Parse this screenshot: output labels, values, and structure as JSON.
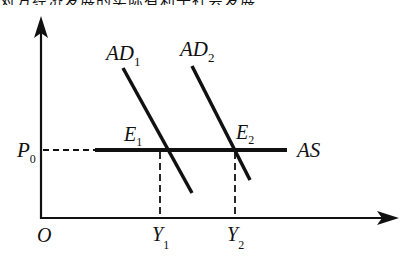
{
  "header": {
    "cropped_text": "对方经济发展的实际有利于社会发展"
  },
  "diagram": {
    "type": "AD-AS model",
    "axes": {
      "origin_label": "O",
      "y_axis": {
        "label": "",
        "arrow": true
      },
      "x_axis": {
        "label": "",
        "arrow": true
      }
    },
    "curves": [
      {
        "id": "AD1",
        "label": "AD",
        "subscript": "1",
        "kind": "downward-sloping"
      },
      {
        "id": "AD2",
        "label": "AD",
        "subscript": "2",
        "kind": "downward-sloping"
      },
      {
        "id": "AS",
        "label": "AS",
        "subscript": "",
        "kind": "horizontal"
      }
    ],
    "points": [
      {
        "id": "E1",
        "label": "E",
        "subscript": "1"
      },
      {
        "id": "E2",
        "label": "E",
        "subscript": "2"
      }
    ],
    "price_level": {
      "label": "P",
      "subscript": "0"
    },
    "output_levels": [
      {
        "label": "Y",
        "subscript": "1"
      },
      {
        "label": "Y",
        "subscript": "2"
      }
    ],
    "colors": {
      "lines": "#111111",
      "background": "#ffffff"
    }
  }
}
